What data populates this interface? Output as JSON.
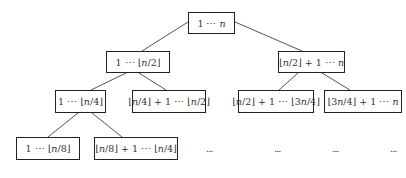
{
  "diagram": {
    "type": "binary-recursion-tree",
    "colors": {
      "border": "#222222",
      "edge": "#555555",
      "text": "#333333",
      "background": "#ffffff"
    },
    "nodes": [
      {
        "id": "root",
        "label": "1 ⋯ n",
        "level": 0,
        "box": [
          188,
          12,
          47,
          22
        ]
      },
      {
        "id": "l1-left",
        "label": "1 ⋯ ⌊n/2⌋",
        "level": 1,
        "box": [
          106,
          51,
          64,
          22
        ]
      },
      {
        "id": "l1-right",
        "label": "⌊n/2⌋ + 1 ⋯ n",
        "level": 1,
        "box": [
          278,
          51,
          67,
          22
        ]
      },
      {
        "id": "l2-a",
        "label": "1 ⋯ ⌊n/4⌋",
        "level": 2,
        "box": [
          55,
          90,
          51,
          23
        ]
      },
      {
        "id": "l2-b",
        "label": "⌊n/4⌋ + 1 ⋯ ⌊n/2⌋",
        "level": 2,
        "box": [
          132,
          90,
          74,
          23
        ]
      },
      {
        "id": "l2-c",
        "label": "⌊n/2⌋ + 1 ⋯ ⌊3n/4⌋",
        "level": 2,
        "box": [
          238,
          90,
          76,
          23
        ]
      },
      {
        "id": "l2-d",
        "label": "⌊3n/4⌋ + 1 ⋯ n",
        "level": 2,
        "box": [
          324,
          90,
          78,
          23
        ]
      },
      {
        "id": "l3-a",
        "label": "1 ⋯ ⌊n/8⌋",
        "level": 3,
        "box": [
          16,
          137,
          64,
          23
        ]
      },
      {
        "id": "l3-b",
        "label": "⌊n/8⌋ + 1 ⋯ ⌊n/4⌋",
        "level": 3,
        "box": [
          94,
          137,
          84,
          23
        ]
      }
    ],
    "edges": [
      {
        "from": "root",
        "to": "l1-left",
        "line": [
          188,
          22,
          142,
          51
        ]
      },
      {
        "from": "root",
        "to": "l1-right",
        "line": [
          235,
          22,
          302,
          51
        ]
      },
      {
        "from": "l1-left",
        "to": "l2-a",
        "line": [
          126,
          73,
          91,
          90
        ]
      },
      {
        "from": "l1-left",
        "to": "l2-b",
        "line": [
          139,
          73,
          166,
          90
        ]
      },
      {
        "from": "l1-right",
        "to": "l2-c",
        "line": [
          298,
          73,
          279,
          90
        ]
      },
      {
        "from": "l1-right",
        "to": "l2-d",
        "line": [
          322,
          73,
          350,
          90
        ]
      },
      {
        "from": "l2-a",
        "to": "l3-a",
        "line": [
          78,
          113,
          48,
          137
        ]
      },
      {
        "from": "l2-a",
        "to": "l3-b",
        "line": [
          92,
          113,
          122,
          137
        ]
      }
    ],
    "ellipses": [
      {
        "label": "...",
        "pos": [
          206,
          143
        ]
      },
      {
        "label": "...",
        "pos": [
          274,
          143
        ]
      },
      {
        "label": "...",
        "pos": [
          332,
          143
        ]
      },
      {
        "label": "...",
        "pos": [
          390,
          143
        ]
      }
    ]
  }
}
